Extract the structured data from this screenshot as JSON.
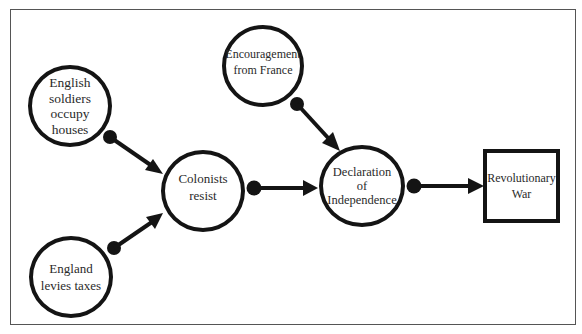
{
  "diagram": {
    "type": "cause-and-effect flow",
    "nodes": [
      {
        "id": "soldiers",
        "shape": "circle",
        "label": "English\nsoldiers\noccupy\nhouses"
      },
      {
        "id": "taxes",
        "shape": "circle",
        "label": "England\nlevies taxes"
      },
      {
        "id": "resist",
        "shape": "circle",
        "label": "Colonists\nresist"
      },
      {
        "id": "france",
        "shape": "circle",
        "label": "Encouragement\nfrom France"
      },
      {
        "id": "declaration",
        "shape": "circle",
        "label": "Declaration\nof\nIndependence"
      },
      {
        "id": "war",
        "shape": "rectangle",
        "label": "Revolutionary\nWar"
      }
    ],
    "edges": [
      {
        "from": "soldiers",
        "to": "resist"
      },
      {
        "from": "taxes",
        "to": "resist"
      },
      {
        "from": "resist",
        "to": "declaration"
      },
      {
        "from": "france",
        "to": "declaration"
      },
      {
        "from": "declaration",
        "to": "war"
      }
    ],
    "colors": {
      "stroke": "#141414",
      "text": "#2a2a2a",
      "background": "#ffffff"
    }
  }
}
